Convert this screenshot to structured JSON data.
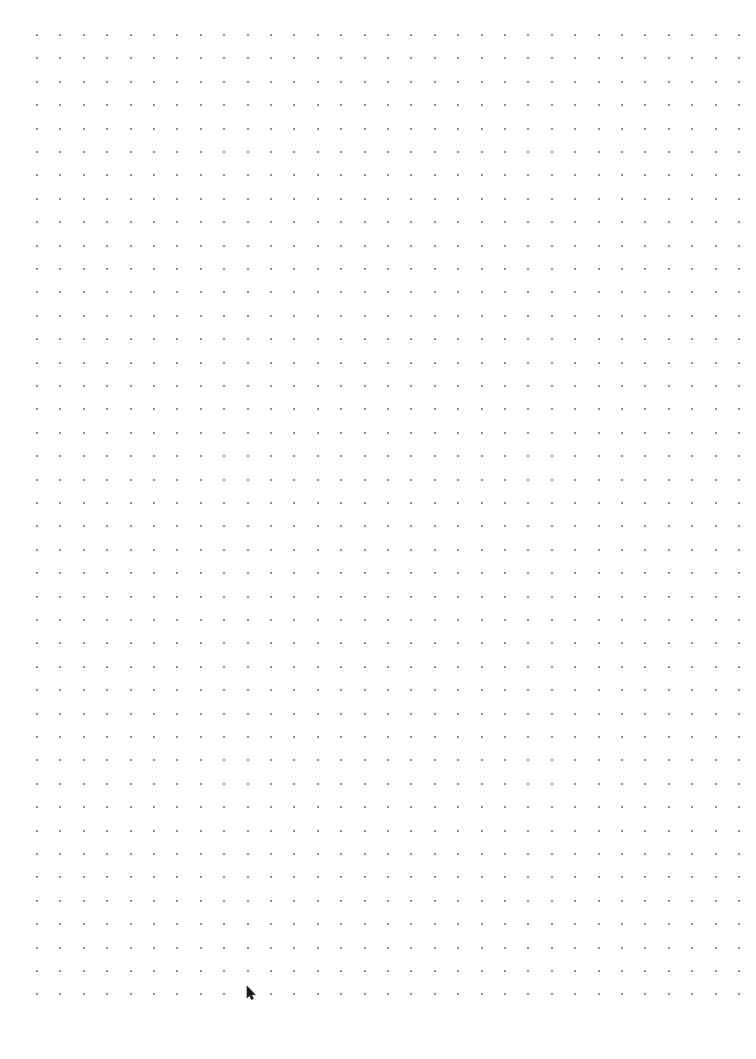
{
  "page": {
    "kind": "blank-dot-grid-paper",
    "width": 756,
    "height": 1059,
    "background_color": "#ffffff"
  },
  "grid": {
    "dot_color": "#8f8f99",
    "dot_size_px": 2,
    "spacing_px": 23.4,
    "origin_x_px": 36,
    "origin_y_px": 34,
    "columns": 31,
    "rows": 42,
    "margins": {
      "left_px": 36,
      "top_px": 34,
      "right_px": 18,
      "bottom_px": 66
    }
  },
  "cursor": {
    "name": "mouse-pointer",
    "visible": true,
    "x_px": 246,
    "y_px": 986,
    "color": "#1a1a1a"
  },
  "content": {
    "text": "",
    "note": ""
  }
}
